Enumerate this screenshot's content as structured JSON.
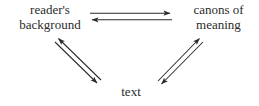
{
  "diagram": {
    "type": "cycle-diagram",
    "background_color": "#ffffff",
    "line_color": "#2b2b2b",
    "text_color": "#2b2b2b",
    "nodes": [
      {
        "id": "reader-background",
        "lines": [
          "reader's",
          "background"
        ]
      },
      {
        "id": "canons-meaning",
        "lines": [
          "canons of",
          "meaning"
        ]
      },
      {
        "id": "text",
        "lines": [
          "text"
        ]
      }
    ],
    "edges": [
      {
        "id": "reader-to-canons",
        "from": "reader-background",
        "to": "canons-meaning",
        "direction": "right"
      },
      {
        "id": "canons-to-reader",
        "from": "canons-meaning",
        "to": "reader-background",
        "direction": "left"
      },
      {
        "id": "text-to-reader",
        "from": "text",
        "to": "reader-background",
        "direction": "up-left"
      },
      {
        "id": "reader-to-text",
        "from": "reader-background",
        "to": "text",
        "direction": "down-right"
      },
      {
        "id": "text-to-canons",
        "from": "text",
        "to": "canons-meaning",
        "direction": "up-right"
      },
      {
        "id": "canons-to-text",
        "from": "canons-meaning",
        "to": "text",
        "direction": "down-left"
      }
    ]
  }
}
